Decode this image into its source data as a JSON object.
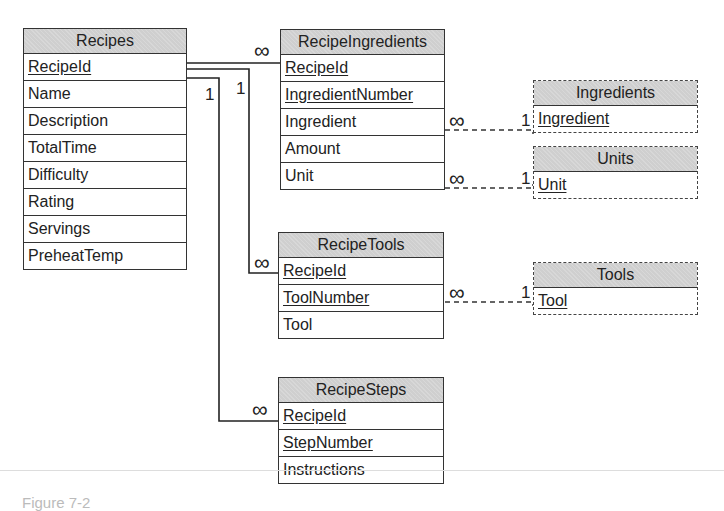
{
  "diagram": {
    "type": "entity-relationship",
    "tables": [
      {
        "name": "Recipes",
        "style": "solid",
        "fields": [
          {
            "name": "RecipeId",
            "key": true
          },
          {
            "name": "Name",
            "key": false
          },
          {
            "name": "Description",
            "key": false
          },
          {
            "name": "TotalTime",
            "key": false
          },
          {
            "name": "Difficulty",
            "key": false
          },
          {
            "name": "Rating",
            "key": false
          },
          {
            "name": "Servings",
            "key": false
          },
          {
            "name": "PreheatTemp",
            "key": false
          }
        ]
      },
      {
        "name": "RecipeIngredients",
        "style": "solid",
        "fields": [
          {
            "name": "RecipeId",
            "key": true
          },
          {
            "name": "IngredientNumber",
            "key": true
          },
          {
            "name": "Ingredient",
            "key": false
          },
          {
            "name": "Amount",
            "key": false
          },
          {
            "name": "Unit",
            "key": false
          }
        ]
      },
      {
        "name": "Ingredients",
        "style": "dashed",
        "fields": [
          {
            "name": "Ingredient",
            "key": true
          }
        ]
      },
      {
        "name": "Units",
        "style": "dashed",
        "fields": [
          {
            "name": "Unit",
            "key": true
          }
        ]
      },
      {
        "name": "RecipeTools",
        "style": "solid",
        "fields": [
          {
            "name": "RecipeId",
            "key": true
          },
          {
            "name": "ToolNumber",
            "key": true
          },
          {
            "name": "Tool",
            "key": false
          }
        ]
      },
      {
        "name": "Tools",
        "style": "dashed",
        "fields": [
          {
            "name": "Tool",
            "key": true
          }
        ]
      },
      {
        "name": "RecipeSteps",
        "style": "solid",
        "fields": [
          {
            "name": "RecipeId",
            "key": true
          },
          {
            "name": "StepNumber",
            "key": true
          },
          {
            "name": "Instructions",
            "key": false
          }
        ]
      }
    ],
    "relationships": [
      {
        "from": "Recipes.RecipeId",
        "from_card": "1",
        "to": "RecipeIngredients.RecipeId",
        "to_card": "∞",
        "line": "solid"
      },
      {
        "from": "Recipes.RecipeId",
        "from_card": "1",
        "to": "RecipeTools.RecipeId",
        "to_card": "∞",
        "line": "solid"
      },
      {
        "from": "Recipes.RecipeId",
        "from_card": "1",
        "to": "RecipeSteps.RecipeId",
        "to_card": "∞",
        "line": "solid"
      },
      {
        "from": "RecipeIngredients.Ingredient",
        "from_card": "∞",
        "to": "Ingredients.Ingredient",
        "to_card": "1",
        "line": "dashed"
      },
      {
        "from": "RecipeIngredients.Unit",
        "from_card": "∞",
        "to": "Units.Unit",
        "to_card": "1",
        "line": "dashed"
      },
      {
        "from": "RecipeTools.ToolNumber",
        "from_card": "∞",
        "to": "Tools.Tool",
        "to_card": "1",
        "line": "dashed"
      }
    ],
    "labels": {
      "one": "1",
      "many": "∞"
    }
  },
  "caption": "Figure 7-2"
}
